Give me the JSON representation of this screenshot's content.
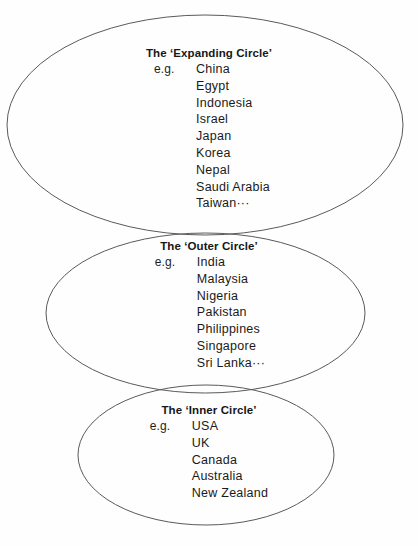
{
  "diagram": {
    "background_color": "#fefefe",
    "line_color": "#5a5a5a",
    "text_color": "#1a1a1a",
    "eg_label": "e.g.",
    "circles": [
      {
        "id": "expanding",
        "name": "The ‘Expanding Circle’",
        "countries": [
          "China",
          "Egypt",
          "Indonesia",
          "Israel",
          "Japan",
          "Korea",
          "Nepal",
          "Saudi Arabia",
          "Taiwan···"
        ]
      },
      {
        "id": "outer",
        "name": "The ‘Outer Circle’",
        "countries": [
          "India",
          "Malaysia",
          "Nigeria",
          "Pakistan",
          "Philippines",
          "Singapore",
          "Sri Lanka···"
        ]
      },
      {
        "id": "inner",
        "name": "The ‘Inner Circle’",
        "countries": [
          "USA",
          "UK",
          "Canada",
          "Australia",
          "New Zealand"
        ]
      }
    ]
  }
}
